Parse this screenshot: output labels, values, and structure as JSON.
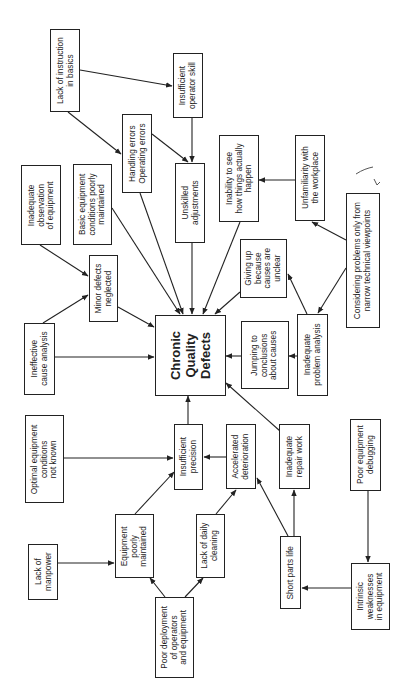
{
  "diagram": {
    "title": "Chronic Quality Defects",
    "orientation": "rotated 90 degrees counter-clockwise",
    "nodes": {
      "lack_of_instruction": "Lack of instruction\nin basics",
      "insufficient_operator_skill": "Insufficient\noperator skill",
      "handling_errors": "Handling errors\nOperating errors",
      "unskilled_adjustments": "Unskilled\nadjustments",
      "inadequate_observation": "Inadequate\nobservation\nof equipment",
      "basic_conditions": "Basic equipment\nconditions poorly\nmaintained",
      "inability_to_see": "Inability to see\nhow things actually\nhappen",
      "unfamiliarity": "Unfamiliarity with\nthe workplace",
      "narrow_viewpoints": "Considering problems only from\nnarrow technical viewpoints",
      "minor_defects": "Minor defects\nneglected",
      "ineffective_cause_analysis": "Ineffective\ncause analysis",
      "chronic_quality_defects": "Chronic\nQuality\nDefects",
      "giving_up": "Giving up\nbecause\ncauses are\nunclear",
      "inadequate_problem_analysis": "Inadequate\nproblem analysis",
      "jumping_to_conclusions": "Jumping to\nconclusions\nabout causes",
      "optimal_conditions_not_known": "Optimal equipment\nconditions\nnot known",
      "insufficient_precision": "Insufficient\nprecision",
      "accelerated_deterioration": "Accelerated\ndeterioration",
      "inadequate_repair_work": "Inadequate\nrepair work",
      "poor_equipment_debugging": "Poor equipment\ndebugging",
      "lack_of_manpower": "Lack of\nmanpower",
      "equipment_poorly_maintained": "Equipment\npoorly\nmaintained",
      "lack_of_daily_cleaning": "Lack of daily\ncleaning",
      "short_parts_life": "Short parts life",
      "poor_deployment": "Poor deployment\nof operators\nand equipment",
      "intrinsic_weaknesses": "Intrinsic\nweaknesses\nin equipment"
    },
    "edges": [
      {
        "from": "Lack of instruction in basics",
        "to": "Insufficient operator skill"
      },
      {
        "from": "Lack of instruction in basics",
        "to": "Handling errors / Operating errors"
      },
      {
        "from": "Insufficient operator skill",
        "to": "Unskilled adjustments"
      },
      {
        "from": "Handling errors / Operating errors",
        "to": "Unskilled adjustments"
      },
      {
        "from": "Handling errors / Operating errors",
        "to": "Chronic Quality Defects"
      },
      {
        "from": "Unskilled adjustments",
        "to": "Chronic Quality Defects"
      },
      {
        "from": "Basic equipment conditions poorly maintained",
        "to": "Chronic Quality Defects"
      },
      {
        "from": "Inadequate observation of equipment",
        "to": "Minor defects neglected"
      },
      {
        "from": "Ineffective cause analysis",
        "to": "Minor defects neglected"
      },
      {
        "from": "Minor defects neglected",
        "to": "Chronic Quality Defects"
      },
      {
        "from": "Ineffective cause analysis",
        "to": "Chronic Quality Defects"
      },
      {
        "from": "Inability to see how things actually happen",
        "to": "Chronic Quality Defects"
      },
      {
        "from": "Unfamiliarity with the workplace",
        "to": "Inability to see how things actually happen"
      },
      {
        "from": "Considering problems only from narrow technical viewpoints",
        "to": "Unfamiliarity with the workplace"
      },
      {
        "from": "Considering problems only from narrow technical viewpoints",
        "to": "Inadequate problem analysis"
      },
      {
        "from": "Inadequate problem analysis",
        "to": "Giving up because causes are unclear"
      },
      {
        "from": "Inadequate problem analysis",
        "to": "Jumping to conclusions about causes"
      },
      {
        "from": "Giving up because causes are unclear",
        "to": "Chronic Quality Defects"
      },
      {
        "from": "Jumping to conclusions about causes",
        "to": "Chronic Quality Defects"
      },
      {
        "from": "Insufficient precision",
        "to": "Chronic Quality Defects"
      },
      {
        "from": "Optimal equipment conditions not known",
        "to": "Insufficient precision"
      },
      {
        "from": "Accelerated deterioration",
        "to": "Insufficient precision"
      },
      {
        "from": "Inadequate repair work",
        "to": "Chronic Quality Defects"
      },
      {
        "from": "Equipment poorly maintained",
        "to": "Insufficient precision"
      },
      {
        "from": "Lack of manpower",
        "to": "Equipment poorly maintained"
      },
      {
        "from": "Poor deployment of operators and equipment",
        "to": "Equipment poorly maintained"
      },
      {
        "from": "Poor deployment of operators and equipment",
        "to": "Lack of daily cleaning"
      },
      {
        "from": "Lack of daily cleaning",
        "to": "Accelerated deterioration"
      },
      {
        "from": "Short parts life",
        "to": "Accelerated deterioration"
      },
      {
        "from": "Short parts life",
        "to": "Inadequate repair work"
      },
      {
        "from": "Intrinsic weaknesses in equipment",
        "to": "Short parts life"
      },
      {
        "from": "Poor equipment debugging",
        "to": "Intrinsic weaknesses in equipment"
      }
    ],
    "annotation": "handwritten check mark"
  }
}
